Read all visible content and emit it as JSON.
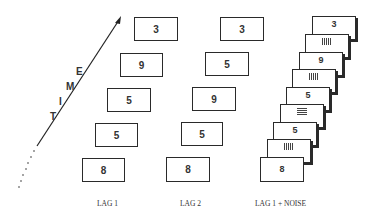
{
  "figure": {
    "axis_label_letters": [
      "T",
      "I",
      "M",
      "E"
    ],
    "axis_label": "TIME",
    "columns": [
      {
        "label": "LAG 1",
        "cards": [
          "3",
          "9",
          "5",
          "5",
          "8"
        ]
      },
      {
        "label": "LAG 2",
        "cards": [
          "3",
          "5",
          "9",
          "5",
          "8"
        ]
      },
      {
        "label": "LAG 1 + NOISE",
        "cards": [
          {
            "type": "digit",
            "value": "3"
          },
          {
            "type": "noise",
            "value": "vertical-bars"
          },
          {
            "type": "digit",
            "value": "9"
          },
          {
            "type": "noise",
            "value": "vertical-bars"
          },
          {
            "type": "digit",
            "value": "5"
          },
          {
            "type": "noise",
            "value": "horizontal-bars"
          },
          {
            "type": "digit",
            "value": "5"
          },
          {
            "type": "noise",
            "value": "vertical-bars"
          },
          {
            "type": "digit",
            "value": "8"
          }
        ]
      }
    ]
  }
}
